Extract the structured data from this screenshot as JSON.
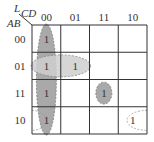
{
  "kmap": {
    "corner_label_top": "L",
    "col_var_label": "CD",
    "row_var_label": "AB",
    "col_headers": [
      "00",
      "01",
      "11",
      "10"
    ],
    "row_headers": [
      "00",
      "01",
      "11",
      "10"
    ],
    "cells": [
      [
        "1",
        "",
        "",
        ""
      ],
      [
        "1",
        "1",
        "",
        ""
      ],
      [
        "1",
        "",
        "1",
        ""
      ],
      [
        "1",
        "",
        "",
        "1"
      ]
    ],
    "groups": [
      {
        "name": "column-00-group",
        "cells": [
          [
            0,
            0
          ],
          [
            1,
            0
          ],
          [
            2,
            0
          ],
          [
            3,
            0
          ]
        ],
        "style": "shaded"
      },
      {
        "name": "row-01-pair-group",
        "cells": [
          [
            1,
            0
          ],
          [
            1,
            1
          ]
        ],
        "style": "light-shaded"
      },
      {
        "name": "single-1111-group",
        "cells": [
          [
            2,
            2
          ]
        ],
        "style": "shaded"
      },
      {
        "name": "wrap-row-10-pair-group",
        "cells": [
          [
            3,
            0
          ],
          [
            3,
            3
          ]
        ],
        "style": "dashed-outline"
      }
    ]
  }
}
